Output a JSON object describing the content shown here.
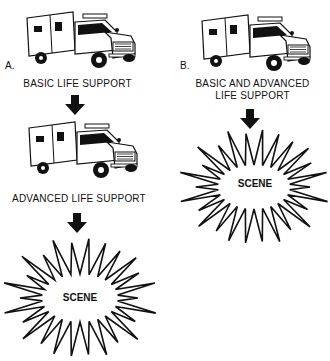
{
  "panel_a": {
    "letter": "A.",
    "stage1_label": "BASIC LIFE SUPPORT",
    "stage2_label": "ADVANCED LIFE SUPPORT",
    "scene_label": "SCENE",
    "icons": [
      "ambulance-icon",
      "down-arrow-icon",
      "ambulance-icon",
      "down-arrow-icon",
      "starburst-icon"
    ]
  },
  "panel_b": {
    "letter": "B.",
    "label_line1": "BASIC AND ADVANCED",
    "label_line2": "LIFE SUPPORT",
    "scene_label": "SCENE",
    "icons": [
      "ambulance-icon",
      "down-arrow-icon",
      "starburst-icon"
    ]
  },
  "colors": {
    "ink": "#111111",
    "background": "#ffffff"
  }
}
